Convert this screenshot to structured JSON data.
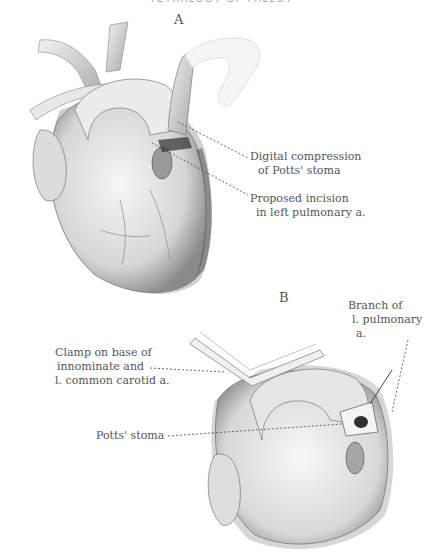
{
  "page": {
    "running_header": "TETRALOGY OF FALLOT"
  },
  "panels": [
    {
      "letter": "A",
      "labels": [
        {
          "line1": "Digital compression",
          "line2": "of  Potts' stoma"
        },
        {
          "line1": "Proposed incision",
          "line2": "in left pulmonary a."
        }
      ]
    },
    {
      "letter": "B",
      "labels": [
        {
          "line1": "Branch of",
          "line2": "l. pulmonary",
          "line3": "a."
        },
        {
          "line1": "Clamp on base of",
          "line2": "innominate and",
          "line3": "l. common carotid a."
        },
        {
          "line1": "Potts' stoma"
        }
      ]
    }
  ],
  "colors": {
    "ink": "#555555",
    "shade_dark": "#3a3a3a",
    "shade_mid": "#9a9a9a",
    "shade_light": "#d8d8d8",
    "paper": "#ffffff"
  }
}
